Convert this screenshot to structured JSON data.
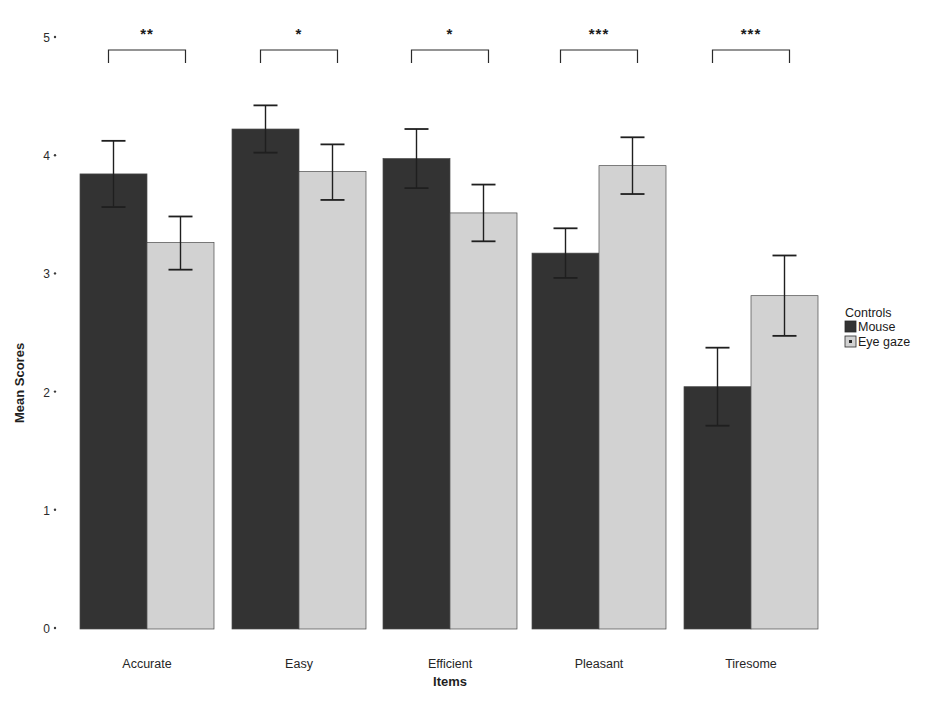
{
  "chart_data": {
    "type": "bar",
    "title": "",
    "xlabel": "Items",
    "ylabel": "Mean Scores",
    "categories": [
      "Accurate",
      "Easy",
      "Efficient",
      "Pleasant",
      "Tiresome"
    ],
    "ylim": [
      0,
      5
    ],
    "yticks": [
      "0",
      "1",
      "2",
      "3",
      "4",
      "5"
    ],
    "grid": false,
    "legend": {
      "title": "Controls",
      "position": "right",
      "entries": [
        {
          "name": "Mouse",
          "color": "#333333"
        },
        {
          "name": "Eye gaze",
          "color": "#d2d2d2"
        }
      ]
    },
    "series": [
      {
        "name": "Mouse",
        "color": "#333333",
        "values": [
          3.85,
          4.23,
          3.98,
          3.18,
          2.05
        ],
        "error_upper": [
          4.13,
          4.43,
          4.23,
          3.39,
          2.38
        ],
        "error_lower": [
          3.57,
          4.03,
          3.73,
          2.97,
          1.72
        ]
      },
      {
        "name": "Eye gaze",
        "color": "#d2d2d2",
        "values": [
          3.27,
          3.87,
          3.52,
          3.92,
          2.82
        ],
        "error_upper": [
          3.49,
          4.1,
          3.76,
          4.16,
          3.16
        ],
        "error_lower": [
          3.04,
          3.63,
          3.28,
          3.68,
          2.48
        ]
      }
    ],
    "annotations": [
      {
        "category": "Accurate",
        "significance": "**"
      },
      {
        "category": "Easy",
        "significance": "*"
      },
      {
        "category": "Efficient",
        "significance": "*"
      },
      {
        "category": "Pleasant",
        "significance": "***"
      },
      {
        "category": "Tiresome",
        "significance": "***"
      }
    ]
  }
}
